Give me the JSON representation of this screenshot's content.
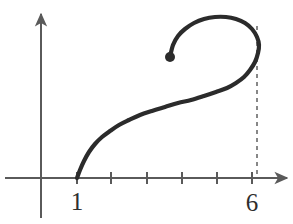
{
  "figure": {
    "background_color": "#ffffff",
    "axis_color": "#5a5a5a",
    "curve_color": "#2b2b2b",
    "label_color": "#2e2e2e",
    "dash_color": "#6a6a6a"
  },
  "axes": {
    "x_axis": {
      "name": "x-axis",
      "y_pixel": 178,
      "x_start_pixel": 5,
      "x_end_pixel": 287,
      "has_arrow": true,
      "arrow_direction": "right"
    },
    "y_axis": {
      "name": "y-axis",
      "x_pixel": 41,
      "y_start_pixel": 218,
      "y_end_pixel": 14,
      "has_arrow": true,
      "arrow_direction": "up"
    },
    "ticks": {
      "pixel_positions": [
        77,
        111,
        147,
        182,
        217,
        252
      ],
      "values": [
        1,
        2,
        3,
        4,
        5,
        6
      ],
      "tick_half_height": 6
    },
    "labeled_ticks": [
      {
        "label": "1",
        "value": 1,
        "x_pixel": 77,
        "y_pixel": 210
      },
      {
        "label": "6",
        "value": 6,
        "x_pixel": 252,
        "y_pixel": 211
      }
    ]
  },
  "annotations": {
    "dashed_line": {
      "name": "asymptote-guide-at-6",
      "x_pixel": 257,
      "y_top_pixel": 26,
      "y_bottom_pixel": 178,
      "dash_pattern": "4 4",
      "at_value": 6
    },
    "endpoint_dot": {
      "name": "curve-endpoint",
      "x_pixel": 170,
      "y_pixel": 57,
      "radius": 5
    },
    "start_point": {
      "name": "curve-start",
      "x_pixel": 77,
      "y_pixel": 178,
      "at_value": 1
    }
  },
  "chart_data": {
    "type": "line",
    "xlabel": "",
    "ylabel": "",
    "grid": false,
    "legend": null,
    "xlim": [
      0,
      7.4
    ],
    "ylim": [
      0,
      4.8
    ],
    "xticks": [
      1,
      2,
      3,
      4,
      5,
      6
    ],
    "xtick_labels": [
      "1",
      "",
      "",
      "",
      "",
      "6"
    ],
    "yticks": [],
    "ytick_labels": [],
    "stroke_width": 4.2,
    "series": [
      {
        "name": "spiral-curve",
        "color": "#2b2b2b",
        "start_marker": "none",
        "end_marker": "dot",
        "path_pixels": [
          [
            77,
            178
          ],
          [
            80,
            170
          ],
          [
            84,
            161
          ],
          [
            89,
            152
          ],
          [
            95,
            144
          ],
          [
            102,
            137
          ],
          [
            110,
            131
          ],
          [
            119,
            125
          ],
          [
            129,
            120
          ],
          [
            140,
            115
          ],
          [
            152,
            111
          ],
          [
            165,
            107
          ],
          [
            178,
            103
          ],
          [
            191,
            100
          ],
          [
            204,
            96
          ],
          [
            216,
            92
          ],
          [
            227,
            88
          ],
          [
            236,
            83
          ],
          [
            244,
            77
          ],
          [
            250,
            70
          ],
          [
            255,
            62
          ],
          [
            258,
            53
          ],
          [
            259,
            45
          ],
          [
            257,
            37
          ],
          [
            252,
            29
          ],
          [
            245,
            23
          ],
          [
            236,
            19
          ],
          [
            226,
            17
          ],
          [
            215,
            17
          ],
          [
            204,
            19
          ],
          [
            194,
            23
          ],
          [
            185,
            29
          ],
          [
            178,
            36
          ],
          [
            173,
            45
          ],
          [
            170,
            57
          ]
        ]
      }
    ]
  }
}
